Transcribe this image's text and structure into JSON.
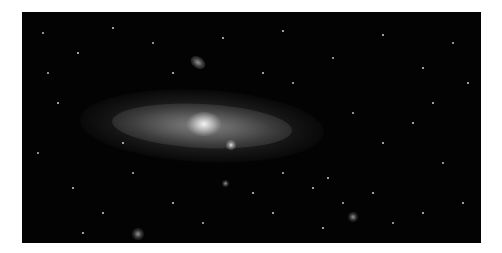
{
  "image": {
    "subject": "spiral galaxy (Andromeda-like) with satellite galaxies on a star field",
    "style": "grayscale astrophotograph",
    "colors": {
      "background": "#030303",
      "frame": "#ffffff",
      "core": "#f4f4f4"
    }
  },
  "stars": [
    [
      20,
      20
    ],
    [
      55,
      40
    ],
    [
      90,
      15
    ],
    [
      130,
      30
    ],
    [
      200,
      25
    ],
    [
      260,
      18
    ],
    [
      310,
      45
    ],
    [
      360,
      22
    ],
    [
      400,
      55
    ],
    [
      430,
      30
    ],
    [
      445,
      70
    ],
    [
      35,
      90
    ],
    [
      15,
      140
    ],
    [
      50,
      175
    ],
    [
      80,
      200
    ],
    [
      110,
      160
    ],
    [
      150,
      190
    ],
    [
      230,
      180
    ],
    [
      260,
      160
    ],
    [
      290,
      175
    ],
    [
      305,
      165
    ],
    [
      330,
      100
    ],
    [
      360,
      130
    ],
    [
      390,
      110
    ],
    [
      420,
      150
    ],
    [
      440,
      190
    ],
    [
      400,
      200
    ],
    [
      370,
      210
    ],
    [
      300,
      215
    ],
    [
      250,
      200
    ],
    [
      180,
      210
    ],
    [
      60,
      220
    ],
    [
      100,
      130
    ],
    [
      270,
      70
    ],
    [
      240,
      60
    ],
    [
      150,
      60
    ],
    [
      320,
      190
    ],
    [
      350,
      180
    ],
    [
      410,
      90
    ],
    [
      25,
      60
    ]
  ]
}
